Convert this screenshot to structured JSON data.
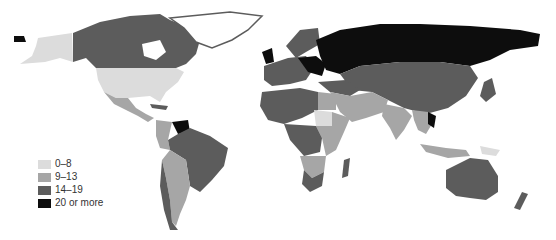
{
  "map": {
    "type": "choropleth-world-map",
    "colors": {
      "bin_0_8": "#dcdcdc",
      "bin_9_13": "#a6a6a6",
      "bin_14_19": "#5c5c5c",
      "bin_20_plus": "#0d0d0d",
      "background": "#ffffff"
    }
  },
  "legend": {
    "items": [
      {
        "label": "0–8",
        "color": "#dcdcdc"
      },
      {
        "label": "9–13",
        "color": "#a6a6a6"
      },
      {
        "label": "14–19",
        "color": "#5c5c5c"
      },
      {
        "label": "20 or more",
        "color": "#0d0d0d"
      }
    ]
  }
}
